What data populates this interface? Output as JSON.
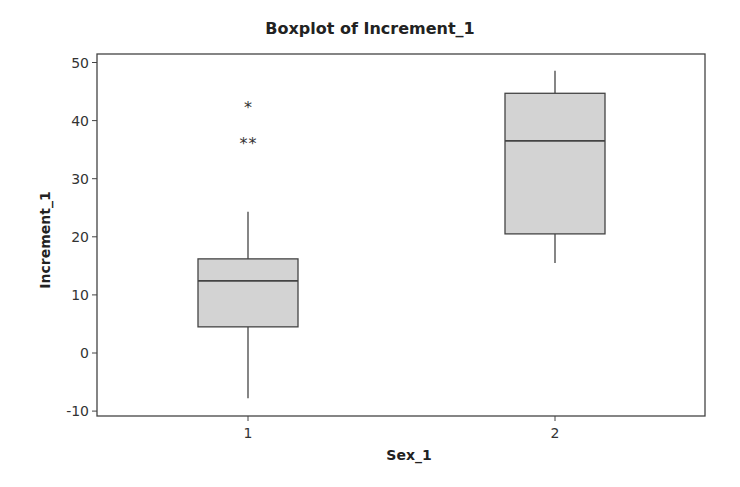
{
  "chart_data": {
    "type": "boxplot",
    "title": "Boxplot of Increment_1",
    "xlabel": "Sex_1",
    "ylabel": "Increment_1",
    "categories": [
      "1",
      "2"
    ],
    "ylim": [
      -11.5,
      51.5
    ],
    "yticks": [
      -10,
      0,
      10,
      20,
      30,
      40,
      50
    ],
    "grid": false,
    "legend": null,
    "boxes": [
      {
        "category": "1",
        "whisker_low": -7.8,
        "q1": 4.5,
        "median": 12.4,
        "q3": 16.2,
        "whisker_high": 24.3,
        "outliers": [
          36.2,
          36.2,
          42.3
        ]
      },
      {
        "category": "2",
        "whisker_low": 15.5,
        "q1": 20.5,
        "median": 36.5,
        "q3": 44.7,
        "whisker_high": 48.6,
        "outliers": []
      }
    ],
    "colors": {
      "box_fill": "#d3d3d3",
      "line": "#444444"
    }
  }
}
